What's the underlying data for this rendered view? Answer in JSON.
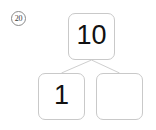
{
  "worksheet": {
    "problem_number": "20",
    "background_color": "#ffffff",
    "box_border_color": "#c9c9c9",
    "line_color": "#cfcfcf",
    "text_color": "#111111"
  },
  "number_bond": {
    "whole": {
      "label": "10",
      "role": "whole",
      "filled": true
    },
    "parts": [
      {
        "label": "1",
        "role": "part",
        "filled": true
      },
      {
        "label": "",
        "role": "part",
        "filled": false
      }
    ]
  }
}
